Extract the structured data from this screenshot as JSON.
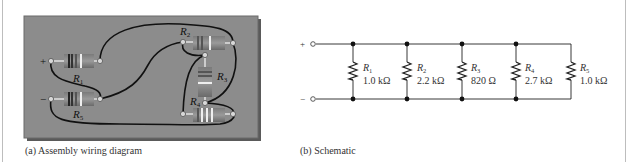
{
  "panel_a": {
    "caption": "(a) Assembly wiring diagram",
    "board_color": "#8c8c8c",
    "terminals": {
      "plus": "+",
      "minus": "−"
    },
    "resistors": [
      {
        "id": "R1",
        "label": "R",
        "sub": "1"
      },
      {
        "id": "R2",
        "label": "R",
        "sub": "2"
      },
      {
        "id": "R3",
        "label": "R",
        "sub": "3"
      },
      {
        "id": "R4",
        "label": "R",
        "sub": "4"
      },
      {
        "id": "R5",
        "label": "R",
        "sub": "5"
      }
    ]
  },
  "panel_b": {
    "caption": "(b) Schematic",
    "terminals": {
      "plus": "+",
      "minus": "−"
    },
    "resistors": [
      {
        "id": "R1",
        "label": "R",
        "sub": "1",
        "value": "1.0 kΩ"
      },
      {
        "id": "R2",
        "label": "R",
        "sub": "2",
        "value": "2.2 kΩ"
      },
      {
        "id": "R3",
        "label": "R",
        "sub": "3",
        "value": "820 Ω"
      },
      {
        "id": "R4",
        "label": "R",
        "sub": "4",
        "value": "2.7 kΩ"
      },
      {
        "id": "R5",
        "label": "R",
        "sub": "5",
        "value": "1.0 kΩ"
      }
    ]
  }
}
